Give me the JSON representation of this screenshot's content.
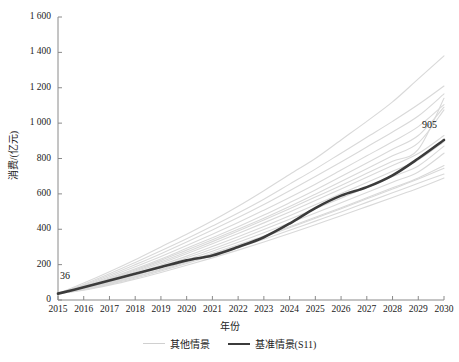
{
  "chart_data": {
    "type": "line",
    "title": "",
    "xlabel": "年份",
    "ylabel": "消费/(亿元)",
    "xlim": [
      2015,
      2030
    ],
    "ylim": [
      0,
      1600
    ],
    "grid": false,
    "legend_position": "bottom",
    "x": [
      2015,
      2016,
      2017,
      2018,
      2019,
      2020,
      2021,
      2022,
      2023,
      2024,
      2025,
      2026,
      2027,
      2028,
      2029,
      2030
    ],
    "xtick_labels": [
      "2015",
      "2016",
      "2017",
      "2018",
      "2019",
      "2020",
      "2021",
      "2022",
      "2023",
      "2024",
      "2025",
      "2026",
      "2027",
      "2028",
      "2029",
      "2030"
    ],
    "ytick_labels": [
      "0",
      "200",
      "400",
      "600",
      "800",
      "1 000",
      "1 200",
      "1 400",
      "1 600"
    ],
    "ytick_values": [
      0,
      200,
      400,
      600,
      800,
      1000,
      1200,
      1400,
      1600
    ],
    "annotations": [
      {
        "label": "36",
        "x": 2015,
        "y": 36
      },
      {
        "label": "905",
        "x": 2030,
        "y": 905
      }
    ],
    "series": [
      {
        "name": "基准情景(S11)",
        "emphasis": "highlight",
        "color": "#3b3b3b",
        "values": [
          36,
          72,
          110,
          148,
          186,
          224,
          252,
          300,
          355,
          432,
          520,
          590,
          638,
          705,
          800,
          905
        ]
      },
      {
        "name": "其他情景",
        "emphasis": "background",
        "color": "#d9d9d9",
        "values": [
          36,
          96,
          160,
          228,
          300,
          372,
          448,
          530,
          618,
          710,
          800,
          905,
          1010,
          1120,
          1250,
          1380
        ]
      },
      {
        "name": "其他情景",
        "emphasis": "background",
        "color": "#d9d9d9",
        "values": [
          36,
          88,
          148,
          212,
          278,
          346,
          418,
          492,
          570,
          655,
          740,
          830,
          920,
          1010,
          1105,
          1210
        ]
      },
      {
        "name": "其他情景",
        "emphasis": "background",
        "color": "#d9d9d9",
        "values": [
          36,
          84,
          140,
          200,
          262,
          328,
          396,
          466,
          540,
          618,
          698,
          780,
          865,
          950,
          1040,
          1165
        ]
      },
      {
        "name": "其他情景",
        "emphasis": "background",
        "color": "#d9d9d9",
        "values": [
          36,
          80,
          132,
          188,
          246,
          308,
          372,
          438,
          508,
          580,
          655,
          735,
          815,
          895,
          980,
          1105
        ]
      },
      {
        "name": "其他情景",
        "emphasis": "background",
        "color": "#d9d9d9",
        "values": [
          36,
          76,
          124,
          176,
          232,
          292,
          352,
          414,
          480,
          550,
          622,
          698,
          775,
          852,
          930,
          1090
        ]
      },
      {
        "name": "其他情景",
        "emphasis": "background",
        "color": "#d9d9d9",
        "values": [
          36,
          74,
          120,
          170,
          224,
          282,
          340,
          400,
          462,
          528,
          598,
          670,
          742,
          815,
          888,
          1075
        ]
      },
      {
        "name": "其他情景",
        "emphasis": "background",
        "color": "#d9d9d9",
        "values": [
          36,
          70,
          112,
          158,
          208,
          262,
          318,
          376,
          436,
          498,
          562,
          628,
          694,
          760,
          828,
          930
        ]
      },
      {
        "name": "其他情景",
        "emphasis": "background",
        "color": "#d9d9d9",
        "values": [
          36,
          68,
          106,
          150,
          198,
          248,
          302,
          358,
          416,
          476,
          538,
          602,
          664,
          728,
          792,
          895
        ]
      },
      {
        "name": "其他情景",
        "emphasis": "background",
        "color": "#d9d9d9",
        "values": [
          36,
          66,
          102,
          144,
          190,
          238,
          288,
          342,
          398,
          456,
          516,
          576,
          636,
          698,
          758,
          870
        ]
      },
      {
        "name": "其他情景",
        "emphasis": "background",
        "color": "#d9d9d9",
        "values": [
          36,
          64,
          98,
          138,
          182,
          228,
          276,
          326,
          380,
          435,
          492,
          550,
          608,
          666,
          724,
          830
        ]
      },
      {
        "name": "其他情景",
        "emphasis": "background",
        "color": "#d9d9d9",
        "values": [
          36,
          62,
          94,
          132,
          174,
          218,
          264,
          312,
          362,
          414,
          468,
          522,
          578,
          634,
          690,
          760
        ]
      },
      {
        "name": "其他情景",
        "emphasis": "background",
        "color": "#d9d9d9",
        "values": [
          36,
          58,
          88,
          124,
          164,
          206,
          250,
          296,
          344,
          394,
          446,
          498,
          552,
          606,
          660,
          712
        ]
      },
      {
        "name": "其他情景",
        "emphasis": "background",
        "color": "#d9d9d9",
        "values": [
          36,
          56,
          84,
          118,
          156,
          196,
          238,
          282,
          328,
          376,
          426,
          476,
          528,
          580,
          632,
          690
        ]
      },
      {
        "name": "其他情景",
        "emphasis": "background",
        "color": "#d9d9d9",
        "values": [
          36,
          70,
          116,
          164,
          216,
          272,
          330,
          390,
          452,
          516,
          582,
          648,
          716,
          784,
          852,
          1140
        ]
      },
      {
        "name": "其他情景",
        "emphasis": "background",
        "color": "#d9d9d9",
        "values": [
          36,
          60,
          92,
          130,
          170,
          212,
          258,
          306,
          356,
          408,
          462,
          516,
          572,
          628,
          684,
          745
        ]
      }
    ]
  },
  "legend": {
    "items": [
      {
        "label": "其他情景",
        "swatch": "other"
      },
      {
        "label": "基准情景(S11)",
        "swatch": "baseline"
      }
    ]
  },
  "axis_titles": {
    "x": "年份",
    "y": "消费/(亿元)"
  }
}
